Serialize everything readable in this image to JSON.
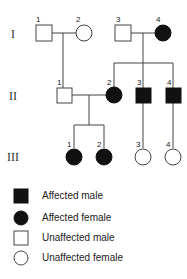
{
  "generations": [
    {
      "label": "I",
      "numbers": [
        "1",
        "2",
        "3",
        "4"
      ]
    },
    {
      "label": "II",
      "numbers": [
        "1",
        "2",
        "3",
        "4"
      ]
    },
    {
      "label": "III",
      "numbers": [
        "1",
        "2",
        "3",
        "4"
      ]
    }
  ],
  "individuals": {
    "I-1": {
      "sex": "male",
      "affected": false
    },
    "I-2": {
      "sex": "female",
      "affected": false
    },
    "I-3": {
      "sex": "male",
      "affected": false
    },
    "I-4": {
      "sex": "female",
      "affected": true
    },
    "II-1": {
      "sex": "male",
      "affected": false
    },
    "II-2": {
      "sex": "female",
      "affected": true
    },
    "II-3": {
      "sex": "male",
      "affected": true
    },
    "II-4": {
      "sex": "male",
      "affected": true
    },
    "III-1": {
      "sex": "female",
      "affected": true
    },
    "III-2": {
      "sex": "female",
      "affected": true
    },
    "III-3": {
      "sex": "female",
      "affected": false
    },
    "III-4": {
      "sex": "female",
      "affected": false
    }
  },
  "legend": [
    {
      "symbol": "filled-square",
      "label": "Affected male"
    },
    {
      "symbol": "filled-circle",
      "label": "Affected female"
    },
    {
      "symbol": "empty-square",
      "label": "Unaffected male"
    },
    {
      "symbol": "empty-circle",
      "label": "Unaffected female"
    }
  ],
  "colors": {
    "affected": "#111111",
    "line": "#444444"
  }
}
